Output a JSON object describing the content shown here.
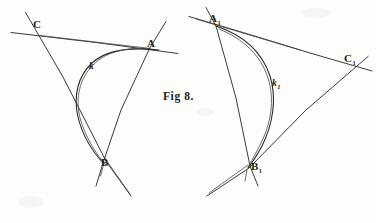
{
  "figure": {
    "caption": "Fig 8.",
    "caption_x": 163,
    "caption_y": 92,
    "background_color": "#fdfdfb",
    "ink_color": "#262423",
    "medium": "pen-and-ink hand drawing on aged paper",
    "panels": [
      {
        "name": "left-panel",
        "curve_label": "k",
        "vertices": [
          {
            "label": "C",
            "x": 38,
            "y": 28,
            "label_x": 33,
            "label_y": 19
          },
          {
            "label": "A",
            "x": 150,
            "y": 47,
            "label_x": 147,
            "label_y": 38
          },
          {
            "label": "B",
            "x": 106,
            "y": 163,
            "label_x": 101,
            "label_y": 158
          }
        ],
        "curve": {
          "label": "k",
          "label_x": 90,
          "label_y": 63,
          "description": "parabolic arc tangent to the three triangle sides, opening toward upper right"
        },
        "lines": [
          {
            "name": "line-CA",
            "from": [
              12,
              33
            ],
            "to": [
              178,
              53
            ]
          },
          {
            "name": "line-CB",
            "from": [
              25,
              13
            ],
            "to": [
              131,
              196
            ]
          },
          {
            "name": "line-AB",
            "from": [
              166,
              22
            ],
            "to": [
              88,
              186
            ]
          }
        ]
      },
      {
        "name": "right-panel",
        "curve_label": "k1",
        "vertices": [
          {
            "label": "A",
            "sub": "1",
            "x": 215,
            "y": 24,
            "label_x": 209,
            "label_y": 14
          },
          {
            "label": "C",
            "sub": "1",
            "x": 348,
            "y": 63,
            "label_x": 345,
            "label_y": 54
          },
          {
            "label": "B",
            "sub": "1",
            "x": 250,
            "y": 167,
            "label_x": 251,
            "label_y": 162
          }
        ],
        "curve": {
          "label": "k",
          "sub": "1",
          "label_x": 273,
          "label_y": 80,
          "description": "parabolic arc tangent to the three triangle sides, bulging toward the right"
        },
        "lines": [
          {
            "name": "line-A1C1",
            "from": [
              190,
              17
            ],
            "to": [
              372,
              71
            ]
          },
          {
            "name": "line-A1B1",
            "from": [
              206,
              8
            ],
            "to": [
              258,
              186
            ]
          },
          {
            "name": "line-B1C1",
            "from": [
              207,
              196
            ],
            "to": [
              368,
              57
            ]
          }
        ]
      }
    ]
  }
}
